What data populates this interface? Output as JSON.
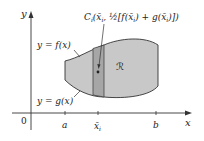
{
  "diagram": {
    "type": "region-between-curves",
    "axes": {
      "x_label": "x",
      "y_label": "y",
      "origin_label": "0",
      "x_ticks": [
        {
          "label": "a",
          "sub": ""
        },
        {
          "label": "x̄",
          "sub": "i"
        },
        {
          "label": "b",
          "sub": ""
        }
      ]
    },
    "curves": {
      "upper_label": "y = f(x)",
      "lower_label": "y = g(x)"
    },
    "region_label": "ℛ",
    "centroid_label": {
      "C": "C",
      "sub_i": "i",
      "open": "(",
      "xbar": "x̄",
      "xsub": "i",
      "comma": ", ",
      "half": "½",
      "bracket_expr": "[f(x̄",
      "mid": ") + g(x̄",
      "close": ")])"
    },
    "colors": {
      "region_fill": "#c8c8c8",
      "strip_fill": "#a6a6a6",
      "stroke": "#333333",
      "background": "#ffffff"
    }
  }
}
